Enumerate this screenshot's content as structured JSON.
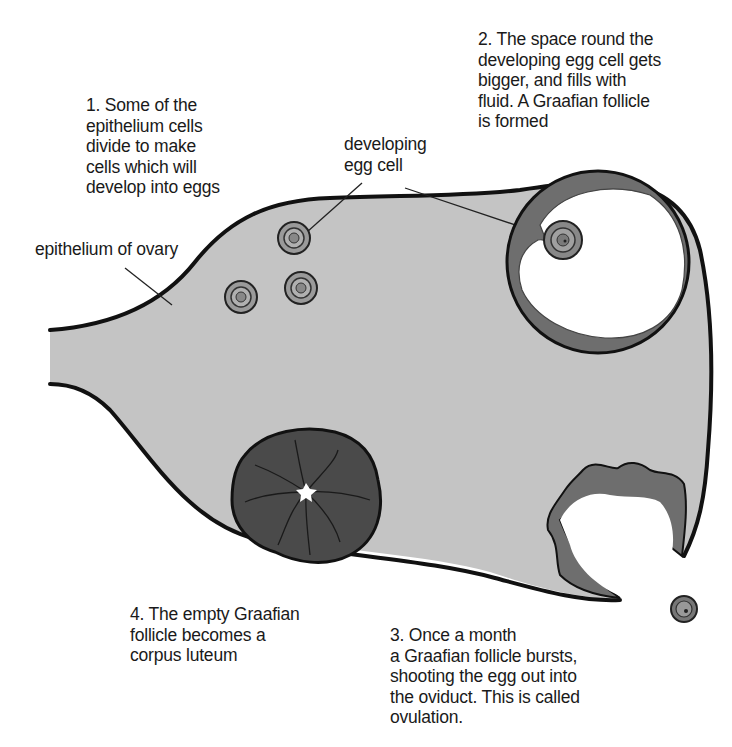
{
  "diagram": {
    "colors": {
      "ovary_fill": "#c4c4c4",
      "outline": "#111111",
      "follicle_wall": "#6e6e6e",
      "corpus_luteum": "#4a4a4a",
      "background": "#ffffff"
    },
    "labels": {
      "step1": "1. Some of the\nepithelium cells\ndivide to make\ncells which will\ndevelop into eggs",
      "step2": "2. The space round the\ndeveloping egg cell gets\nbigger, and fills with\nfluid. A Graafian follicle\nis formed",
      "step3": "3. Once a month\na Graafian follicle bursts,\nshooting the egg out into\nthe oviduct. This is called\novulation.",
      "step4": "4. The empty Graafian\nfollicle becomes a\ncorpus luteum",
      "developing_egg_cell": "developing\negg cell",
      "epithelium_of_ovary": "epithelium of ovary"
    },
    "structures": [
      "epithelium of ovary",
      "developing egg cells (3)",
      "Graafian follicle",
      "bursting follicle",
      "released egg",
      "corpus luteum"
    ]
  }
}
